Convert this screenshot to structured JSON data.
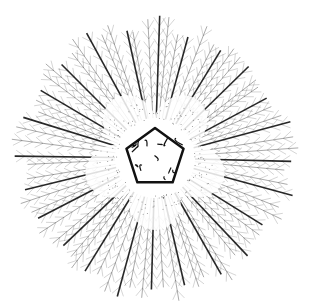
{
  "image": {
    "subject": "line illustration of a radially symmetric organism with feathery arms around a pentagonal central disc",
    "background": "#ffffff",
    "ink": "#111111",
    "center": [
      155,
      158
    ],
    "inner_radius": 30,
    "lobe_radius": 70,
    "outer_radius": 140,
    "arm_count": 72,
    "lobe_count": 5
  }
}
